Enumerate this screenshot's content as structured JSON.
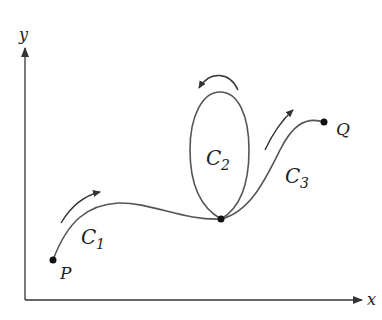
{
  "diagram": {
    "axes": {
      "x_label": "x",
      "y_label": "y"
    },
    "points": {
      "start": "P",
      "end": "Q"
    },
    "curves": [
      {
        "name": "C",
        "subscript": "1",
        "description": "from P to junction"
      },
      {
        "name": "C",
        "subscript": "2",
        "description": "closed loop at junction, counterclockwise"
      },
      {
        "name": "C",
        "subscript": "3",
        "description": "from junction to Q"
      }
    ],
    "colors": {
      "curve": "#555555",
      "axis": "#333333",
      "text": "#222222"
    }
  }
}
